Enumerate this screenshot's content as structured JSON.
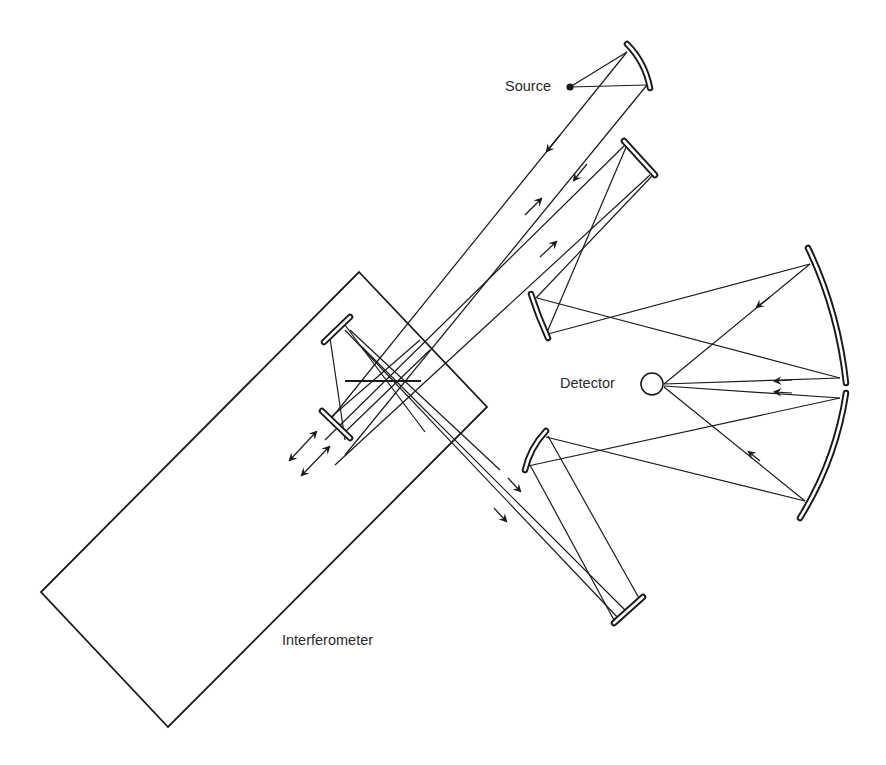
{
  "figure": {
    "type": "optical-schematic",
    "colors": {
      "ink": "#1a1a1a",
      "background": "#ffffff",
      "label": "#2a2a2a"
    }
  },
  "labels": {
    "source": "Source",
    "detector": "Detector",
    "interferometer": "Interferometer"
  },
  "components": [
    {
      "id": "source",
      "kind": "point-source",
      "label": "Source"
    },
    {
      "id": "collimating-mirror",
      "kind": "concave-mirror"
    },
    {
      "id": "fold-mirror-top",
      "kind": "flat-mirror"
    },
    {
      "id": "interferometer",
      "kind": "housing",
      "label": "Interferometer"
    },
    {
      "id": "moving-mirror-upper",
      "kind": "flat-mirror"
    },
    {
      "id": "moving-mirror-lower",
      "kind": "flat-mirror"
    },
    {
      "id": "beamsplitter",
      "kind": "beamsplitter"
    },
    {
      "id": "motion-arrows",
      "kind": "double-arrow",
      "count": 2
    },
    {
      "id": "sample-mirror-upper",
      "kind": "concave-mirror"
    },
    {
      "id": "sample-mirror-lower",
      "kind": "concave-mirror"
    },
    {
      "id": "fold-mirror-bottom",
      "kind": "flat-mirror"
    },
    {
      "id": "ellipsoid-mirror-upper",
      "kind": "concave-mirror"
    },
    {
      "id": "ellipsoid-mirror-lower",
      "kind": "concave-mirror"
    },
    {
      "id": "detector",
      "kind": "detector",
      "label": "Detector"
    }
  ]
}
